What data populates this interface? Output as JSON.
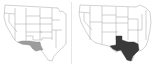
{
  "maps": [
    {
      "id": "left",
      "subject": "United States map (western/central) with southern border region highlighted",
      "highlight_label": "southern border region (southern Arizona, southern New Mexico, far West Texas)",
      "highlight_color": "#9c9c9c",
      "base_fill": "#ffffff",
      "border_color": "#9a9a9a"
    },
    {
      "id": "right",
      "subject": "United States map (western/central) with Texas highlighted",
      "highlight_label": "Texas",
      "highlight_color": "#3a3a3a",
      "base_fill": "#ffffff",
      "border_color": "#9a9a9a"
    }
  ],
  "colors": {
    "background": "#ffffff",
    "divider": "#e6e6e6"
  }
}
